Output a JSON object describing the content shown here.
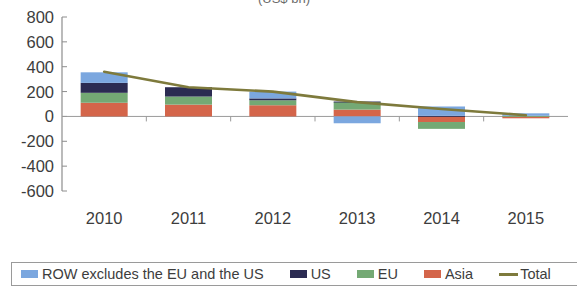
{
  "title_partial": "(US$ bn)",
  "legend": {
    "items": [
      {
        "label": "ROW excludes the EU and the US",
        "color": "#7ba7df",
        "marker": "square"
      },
      {
        "label": "US",
        "color": "#2b2b52",
        "marker": "square"
      },
      {
        "label": "EU",
        "color": "#74a974",
        "marker": "square"
      },
      {
        "label": "Asia",
        "color": "#d4654a",
        "marker": "square"
      },
      {
        "label": "Total",
        "color": "#7e7a3c",
        "marker": "line"
      }
    ]
  },
  "chart_data": {
    "type": "bar",
    "stacked": true,
    "title": "",
    "xlabel": "",
    "ylabel": "",
    "categories": [
      "2010",
      "2011",
      "2012",
      "2013",
      "2014",
      "2015"
    ],
    "ytick_labels": [
      "800",
      "600",
      "400",
      "200",
      "0",
      "-200",
      "-400",
      "-600"
    ],
    "yticks": [
      800,
      600,
      400,
      200,
      0,
      -200,
      -400,
      -600
    ],
    "ylim": [
      -600,
      800
    ],
    "grid": false,
    "legend_position": "bottom",
    "series": [
      {
        "name": "Asia",
        "color": "#d4654a",
        "values": [
          110,
          95,
          90,
          55,
          -45,
          -15
        ]
      },
      {
        "name": "EU",
        "color": "#74a974",
        "values": [
          80,
          65,
          40,
          60,
          -55,
          5
        ]
      },
      {
        "name": "US",
        "color": "#2b2b52",
        "values": [
          80,
          75,
          15,
          5,
          5,
          0
        ]
      },
      {
        "name": "ROW excludes the EU and the US",
        "color": "#7ba7df",
        "values": [
          85,
          0,
          55,
          -55,
          75,
          20
        ]
      }
    ],
    "line_series": {
      "name": "Total",
      "color": "#7e7a3c",
      "values": [
        360,
        235,
        200,
        115,
        60,
        10
      ]
    }
  }
}
